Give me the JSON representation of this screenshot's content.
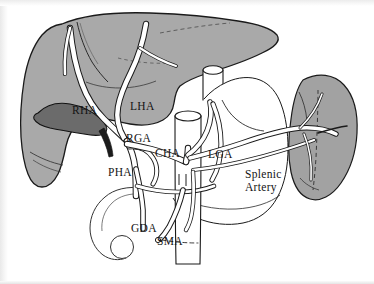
{
  "figure": {
    "background_color": "#ffffff",
    "frame_color": "#b9b9b9"
  },
  "palette": {
    "liver_fill": "#a9a9a9",
    "spleen_fill": "#a2a2a2",
    "gallbladder_fill": "#6b6b6b",
    "vessel_fill": "#ffffff",
    "outline": "#1a1a1a",
    "thin_outline": "#333333",
    "label_color": "#141414"
  },
  "organs": [
    {
      "id": "liver",
      "name": "Liver",
      "fill": "#a9a9a9"
    },
    {
      "id": "gallbladder",
      "name": "Gallbladder",
      "fill": "#6b6b6b"
    },
    {
      "id": "spleen",
      "name": "Spleen",
      "fill": "#a2a2a2"
    },
    {
      "id": "stomach",
      "name": "Stomach",
      "fill": "#ffffff"
    },
    {
      "id": "esophagus",
      "name": "Esophagus",
      "fill": "#ffffff"
    },
    {
      "id": "aorta",
      "name": "Aorta",
      "fill": "#ffffff"
    },
    {
      "id": "duodenum",
      "name": "Duodenum",
      "fill": "#ffffff"
    },
    {
      "id": "pancreas-head",
      "name": "Pancreatic head",
      "fill": "#ffffff"
    }
  ],
  "labels": [
    {
      "id": "rha",
      "text": "RHA",
      "x": 72,
      "y": 114,
      "full_name": "Right Hepatic Artery"
    },
    {
      "id": "lha",
      "text": "LHA",
      "x": 130,
      "y": 110,
      "full_name": "Left Hepatic Artery"
    },
    {
      "id": "rga",
      "text": "RGA",
      "x": 126,
      "y": 142,
      "full_name": "Right Gastric Artery"
    },
    {
      "id": "cha",
      "text": "CHA",
      "x": 155,
      "y": 157,
      "full_name": "Common Hepatic Artery"
    },
    {
      "id": "lga",
      "text": "LGA",
      "x": 208,
      "y": 158,
      "full_name": "Left Gastric Artery"
    },
    {
      "id": "pha",
      "text": "PHA",
      "x": 108,
      "y": 176,
      "full_name": "Proper Hepatic Artery"
    },
    {
      "id": "gda",
      "text": "GDA",
      "x": 131,
      "y": 232,
      "full_name": "Gastroduodenal Artery"
    },
    {
      "id": "sma",
      "text": "SMA",
      "x": 157,
      "y": 245,
      "full_name": "Superior Mesenteric Artery"
    }
  ],
  "multiline_labels": [
    {
      "id": "splenic-artery",
      "lines": [
        "Splenic",
        "Artery"
      ],
      "x": 245,
      "y": 178,
      "line_height": 13,
      "full_name": "Splenic Artery"
    }
  ]
}
